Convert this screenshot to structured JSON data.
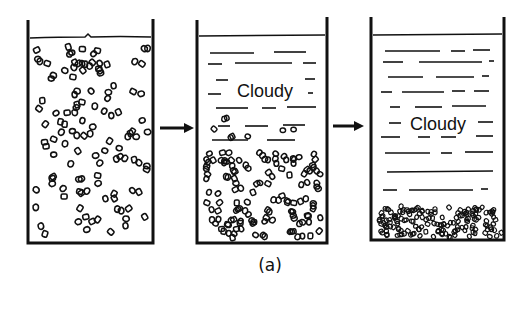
{
  "figure": {
    "caption": "(a)",
    "stages": [
      {
        "id": "stage-1",
        "description": "Uniform suspension of particles throughout the liquid",
        "label": ""
      },
      {
        "id": "stage-2",
        "description": "Particles settling into lower region; cloudy supernatant above",
        "label": "Cloudy"
      },
      {
        "id": "stage-3",
        "description": "Compacted sediment layer at bottom; cloudy supernatant above",
        "label": "Cloudy"
      }
    ],
    "arrows": [
      {
        "from": "stage-1",
        "to": "stage-2",
        "direction": "right"
      },
      {
        "from": "stage-2",
        "to": "stage-3",
        "direction": "right"
      }
    ],
    "colors": {
      "ink": "#111111",
      "background": "#ffffff"
    }
  }
}
